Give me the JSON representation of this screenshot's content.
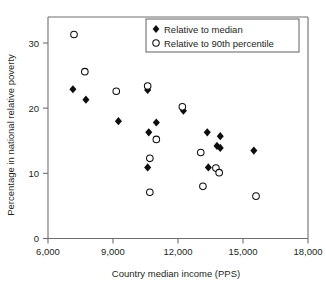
{
  "chart_data": {
    "type": "scatter",
    "title": "",
    "xlabel": "Country median income (PPS)",
    "ylabel": "Percentage in national relative poverty",
    "xlim": [
      6000,
      18000
    ],
    "ylim": [
      0,
      33
    ],
    "xticks": [
      6000,
      9000,
      12000,
      15000,
      18000
    ],
    "xtick_labels": [
      "6,000",
      "9,000",
      "12,000",
      "15,000",
      "18,000"
    ],
    "yticks": [
      0,
      10,
      20,
      30
    ],
    "ytick_labels": [
      "0",
      "10",
      "20",
      "30"
    ],
    "grid": false,
    "legend_position": "top-right",
    "series": [
      {
        "name": "Relative to median",
        "marker": "filled-diamond",
        "color": "#0d0d0d",
        "points": [
          {
            "x": 7150,
            "y": 22.9
          },
          {
            "x": 7750,
            "y": 21.3
          },
          {
            "x": 9250,
            "y": 18.0
          },
          {
            "x": 10600,
            "y": 22.8
          },
          {
            "x": 11000,
            "y": 17.8
          },
          {
            "x": 10650,
            "y": 16.3
          },
          {
            "x": 10600,
            "y": 10.9
          },
          {
            "x": 12250,
            "y": 19.6
          },
          {
            "x": 13350,
            "y": 16.3
          },
          {
            "x": 13950,
            "y": 15.7
          },
          {
            "x": 13800,
            "y": 14.2
          },
          {
            "x": 13950,
            "y": 13.9
          },
          {
            "x": 13400,
            "y": 10.9
          },
          {
            "x": 15500,
            "y": 13.5
          }
        ]
      },
      {
        "name": "Relative to 90th percentile",
        "marker": "open-circle",
        "color": "#0d0d0d",
        "points": [
          {
            "x": 7200,
            "y": 31.3
          },
          {
            "x": 7700,
            "y": 25.6
          },
          {
            "x": 9150,
            "y": 22.6
          },
          {
            "x": 10600,
            "y": 23.4
          },
          {
            "x": 11000,
            "y": 15.2
          },
          {
            "x": 10700,
            "y": 12.3
          },
          {
            "x": 10700,
            "y": 7.1
          },
          {
            "x": 12200,
            "y": 20.2
          },
          {
            "x": 13050,
            "y": 13.2
          },
          {
            "x": 13750,
            "y": 10.8
          },
          {
            "x": 13900,
            "y": 10.1
          },
          {
            "x": 13150,
            "y": 8.0
          },
          {
            "x": 15600,
            "y": 6.5
          }
        ]
      }
    ]
  },
  "legend": {
    "entries": [
      {
        "label": "Relative to median",
        "marker": "filled-diamond"
      },
      {
        "label": "Relative to 90th percentile",
        "marker": "open-circle"
      }
    ]
  }
}
